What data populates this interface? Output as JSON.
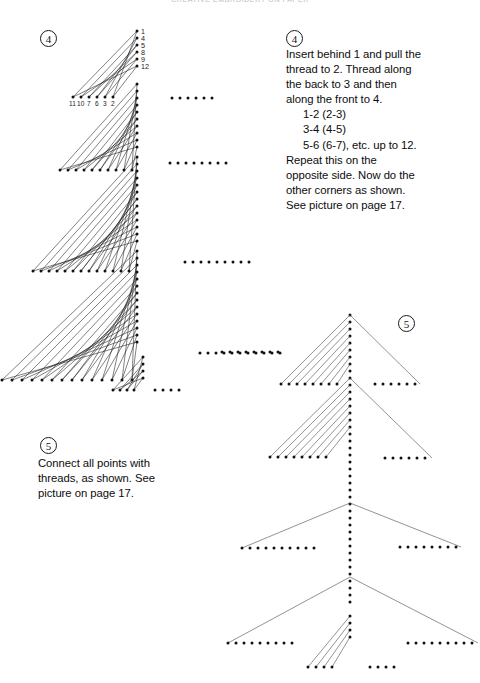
{
  "page": {
    "running_head": "CREATIVE EMBROIDERY ON PAPER",
    "width": 480,
    "height": 683,
    "background": "#ffffff",
    "ink": "#111111"
  },
  "markers": {
    "left_diagram_step": "4",
    "right_text_step": "4",
    "left_text_step": "5",
    "right_diagram_step": "5"
  },
  "instructions": {
    "step4": {
      "number": "4",
      "lines": [
        "Insert behind 1 and pull the",
        "thread to 2. Thread along",
        "the back to 3 and then",
        "along the front to 4.",
        "1-2 (2-3)",
        "3-4 (4-5)",
        "5-6 (6-7), etc. up to 12.",
        "Repeat this on the",
        "opposite side. Now do the",
        "other corners as shown.",
        "See picture on page 17."
      ],
      "indent_lines": [
        4,
        5,
        6
      ]
    },
    "step5": {
      "number": "5",
      "lines": [
        "Connect all points with",
        "threads, as shown. See",
        "picture on page 17."
      ],
      "indent_lines": []
    }
  },
  "diagram_left": {
    "caption_step": "4",
    "vertical_labels": [
      "1",
      "4",
      "5",
      "8",
      "9",
      "12"
    ],
    "horizontal_labels": [
      "11",
      "10",
      "7",
      "6",
      "3",
      "2"
    ],
    "description": "Half-tree curve-stitch construction: four stitched branch tiers plus trunk"
  },
  "diagram_right": {
    "caption_step": "5",
    "description": "Complete fir tree outline built from dotted point rows and straight threads"
  },
  "dot_rows": {
    "left_mid_row1_count": 6,
    "left_mid_row2_count": 8,
    "left_mid_row3_count": 9,
    "left_mid_row4_count": 11,
    "left_trunk_row_count": 4
  }
}
